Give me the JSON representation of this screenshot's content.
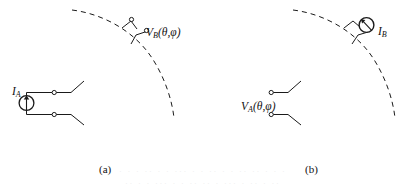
{
  "figure": {
    "type": "circuit-diagram",
    "background_color": "#ffffff",
    "line_color": "#1a1a1a",
    "panels": [
      {
        "id": "a",
        "caption": "(a)",
        "elements": {
          "source_label_main": "I",
          "source_label_sub": "A",
          "probe_label_main": "V",
          "probe_label_sub": "B",
          "probe_label_args": "(θ,φ)",
          "source_type": "current-source-circle-with-up-arrow",
          "probe_type": "open-terminal-pair-on-arc",
          "arc_style": "dashed"
        }
      },
      {
        "id": "b",
        "caption": "(b)",
        "elements": {
          "source_label_main": "I",
          "source_label_sub": "B",
          "probe_label_main": "V",
          "probe_label_sub": "A",
          "probe_label_args": "(θ,φ)",
          "source_type": "current-source-circle-with-diagonal-arrow",
          "probe_type": "open-terminal-pair",
          "arc_style": "dashed"
        }
      }
    ],
    "bleed_text_line_1": "· · ·   ·· · ·  ··· ·  · ··  · · ·· ··  · · ·",
    "bleed_text_line_2": "·· ·  · ··· · ·  ·· ·· · ···  · ·· · ··"
  }
}
